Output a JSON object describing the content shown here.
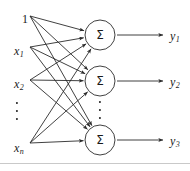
{
  "figure": {
    "type": "diagram",
    "width": 190,
    "height": 171,
    "background": "#ffffff",
    "stroke_color": "#2b2b2b",
    "text_color": "#1a1a1a",
    "rule_color": "#c9c9c9",
    "stroke_width": 0.9
  },
  "inputs": [
    {
      "id": "bias",
      "label": "1",
      "subscript": "",
      "x": 22,
      "y": 13,
      "node_x": 30,
      "node_y": 16
    },
    {
      "id": "x1",
      "label": "x",
      "subscript": "1",
      "x": 14,
      "y": 45,
      "node_x": 30,
      "node_y": 47
    },
    {
      "id": "x2",
      "label": "x",
      "subscript": "2",
      "x": 14,
      "y": 78,
      "node_x": 30,
      "node_y": 80
    },
    {
      "id": "xn",
      "label": "x",
      "subscript": "n",
      "x": 14,
      "y": 142,
      "node_x": 30,
      "node_y": 143
    }
  ],
  "input_ellipsis": {
    "x": 17,
    "y": 111,
    "dots": 3
  },
  "neurons": [
    {
      "id": "sum1",
      "symbol": "Σ",
      "cx": 100,
      "cy": 35,
      "r": 15
    },
    {
      "id": "sum2",
      "symbol": "Σ",
      "cx": 100,
      "cy": 81,
      "r": 15
    },
    {
      "id": "sum3",
      "symbol": "Σ",
      "cx": 100,
      "cy": 140,
      "r": 15
    }
  ],
  "neuron_ellipsis": {
    "x": 100,
    "y": 110,
    "dots": 3
  },
  "outputs": [
    {
      "id": "y1",
      "label": "y",
      "subscript": "1",
      "x": 170,
      "y": 30,
      "arrow_from_x": 117,
      "arrow_to_x": 163,
      "y_line": 35
    },
    {
      "id": "y2",
      "label": "y",
      "subscript": "2",
      "x": 170,
      "y": 76,
      "arrow_from_x": 117,
      "arrow_to_x": 163,
      "y_line": 81
    },
    {
      "id": "y3",
      "label": "y",
      "subscript": "3",
      "x": 170,
      "y": 135,
      "arrow_from_x": 117,
      "arrow_to_x": 163,
      "y_line": 140
    }
  ],
  "connections": [
    {
      "from": "bias",
      "to": "sum1"
    },
    {
      "from": "bias",
      "to": "sum2"
    },
    {
      "from": "bias",
      "to": "sum3"
    },
    {
      "from": "x1",
      "to": "sum1"
    },
    {
      "from": "x1",
      "to": "sum2"
    },
    {
      "from": "x1",
      "to": "sum3"
    },
    {
      "from": "x2",
      "to": "sum1"
    },
    {
      "from": "x2",
      "to": "sum2"
    },
    {
      "from": "x2",
      "to": "sum3"
    },
    {
      "from": "xn",
      "to": "sum1"
    },
    {
      "from": "xn",
      "to": "sum2"
    },
    {
      "from": "xn",
      "to": "sum3"
    }
  ],
  "bottom_rule": {
    "y": 163
  }
}
